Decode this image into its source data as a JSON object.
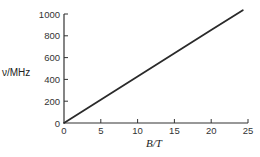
{
  "chart_data": {
    "type": "line",
    "title": "",
    "xlabel": "B/T",
    "ylabel": "ν/MHz",
    "xlim": [
      0,
      25
    ],
    "ylim": [
      0,
      1000
    ],
    "xticks": [
      0,
      5,
      10,
      15,
      20,
      25
    ],
    "yticks": [
      0,
      200,
      400,
      600,
      800,
      1000
    ],
    "grid": false,
    "legend": null,
    "series": [
      {
        "name": "ν vs B",
        "x": [
          0,
          5,
          10,
          15,
          20,
          24.3
        ],
        "y": [
          0,
          213,
          426,
          639,
          852,
          1035
        ]
      }
    ],
    "colors": {
      "line": "#2a2a2a",
      "axis": "#333333"
    }
  }
}
